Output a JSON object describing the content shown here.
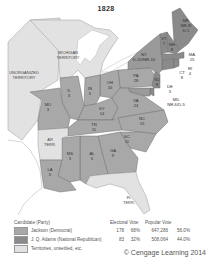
{
  "title": "1828",
  "colors": {
    "jackson": "#a8a8a8",
    "adams": "#8a8a8a",
    "territory": "#e2e2e2",
    "water": "#ffffff",
    "border": "#6e6e6e"
  },
  "territories": [
    {
      "id": "unorganized",
      "label": "UNORGANIZED TERRITORY"
    },
    {
      "id": "michigan",
      "label": "MICHIGAN TERRITORY"
    },
    {
      "id": "arkansas",
      "label": "AR TERR."
    },
    {
      "id": "florida",
      "label": "FL TERR."
    }
  ],
  "states": [
    {
      "abbr": "ME",
      "votes": "NR-8/D-1",
      "winner": "split"
    },
    {
      "abbr": "VT",
      "votes": "7",
      "winner": "adams"
    },
    {
      "abbr": "NH",
      "votes": "8",
      "winner": "adams"
    },
    {
      "abbr": "MA",
      "votes": "15",
      "winner": "adams"
    },
    {
      "abbr": "RI",
      "votes": "4",
      "winner": "adams"
    },
    {
      "abbr": "CT",
      "votes": "8",
      "winner": "adams"
    },
    {
      "abbr": "NY",
      "votes": "D-20/NR-16",
      "winner": "split"
    },
    {
      "abbr": "NJ",
      "votes": "8",
      "winner": "adams"
    },
    {
      "abbr": "DE",
      "votes": "3",
      "winner": "adams"
    },
    {
      "abbr": "MD",
      "votes": "NR-6/D-5",
      "winner": "split"
    },
    {
      "abbr": "PA",
      "votes": "28",
      "winner": "jackson"
    },
    {
      "abbr": "OH",
      "votes": "16",
      "winner": "jackson"
    },
    {
      "abbr": "IN",
      "votes": "5",
      "winner": "jackson"
    },
    {
      "abbr": "IL",
      "votes": "3",
      "winner": "jackson"
    },
    {
      "abbr": "MO",
      "votes": "3",
      "winner": "jackson"
    },
    {
      "abbr": "KY",
      "votes": "14",
      "winner": "jackson"
    },
    {
      "abbr": "VA",
      "votes": "24",
      "winner": "jackson"
    },
    {
      "abbr": "TN",
      "votes": "11",
      "winner": "jackson"
    },
    {
      "abbr": "NC",
      "votes": "15",
      "winner": "jackson"
    },
    {
      "abbr": "SC",
      "votes": "11",
      "winner": "jackson"
    },
    {
      "abbr": "GA",
      "votes": "9",
      "winner": "jackson"
    },
    {
      "abbr": "AL",
      "votes": "5",
      "winner": "jackson"
    },
    {
      "abbr": "MS",
      "votes": "3",
      "winner": "jackson"
    },
    {
      "abbr": "LA",
      "votes": "5",
      "winner": "jackson"
    }
  ],
  "legend": {
    "headers": {
      "candidate": "Candidate (Party)",
      "electoral": "Electoral Vote",
      "popular": "Popular Vote"
    },
    "rows": [
      {
        "candidate": "Jackson (Democrat)",
        "ev": "178",
        "ev_pct": "68%",
        "pv": "647,286",
        "pv_pct": "56.0%",
        "color": "#a8a8a8"
      },
      {
        "candidate": "J. Q. Adams (National Republican)",
        "ev": "83",
        "ev_pct": "32%",
        "pv": "508,064",
        "pv_pct": "44.0%",
        "color": "#8a8a8a"
      },
      {
        "candidate": "Territories, unsettled, etc.",
        "ev": "",
        "ev_pct": "",
        "pv": "",
        "pv_pct": "",
        "color": "#e2e2e2"
      }
    ]
  },
  "copyright": "© Cengage Learning 2014"
}
